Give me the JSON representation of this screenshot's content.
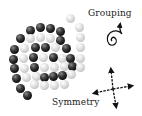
{
  "diagram": {
    "labels": {
      "grouping": "Grouping",
      "symmetry": "Symmetry"
    },
    "icons": {
      "grouping": "spiral-arrow-icon",
      "symmetry": "four-way-arrows-icon"
    },
    "colors": {
      "dark_ball": "#111111",
      "light_ball": "#d0d0d0",
      "ink": "#111111",
      "background": "#ffffff"
    },
    "balls": [
      {
        "x": 30,
        "y": 30,
        "c": "dark"
      },
      {
        "x": 40,
        "y": 27,
        "c": "dark"
      },
      {
        "x": 50,
        "y": 28,
        "c": "dark"
      },
      {
        "x": 60,
        "y": 31,
        "c": "dark"
      },
      {
        "x": 70,
        "y": 18,
        "c": "light"
      },
      {
        "x": 79,
        "y": 27,
        "c": "light"
      },
      {
        "x": 20,
        "y": 38,
        "c": "dark"
      },
      {
        "x": 30,
        "y": 38,
        "c": "light"
      },
      {
        "x": 40,
        "y": 37,
        "c": "light"
      },
      {
        "x": 50,
        "y": 38,
        "c": "light"
      },
      {
        "x": 60,
        "y": 40,
        "c": "dark"
      },
      {
        "x": 80,
        "y": 37,
        "c": "light"
      },
      {
        "x": 14,
        "y": 49,
        "c": "dark"
      },
      {
        "x": 24,
        "y": 48,
        "c": "light"
      },
      {
        "x": 35,
        "y": 47,
        "c": "dark"
      },
      {
        "x": 45,
        "y": 47,
        "c": "dark"
      },
      {
        "x": 55,
        "y": 47,
        "c": "light"
      },
      {
        "x": 66,
        "y": 48,
        "c": "dark"
      },
      {
        "x": 80,
        "y": 47,
        "c": "light"
      },
      {
        "x": 13,
        "y": 59,
        "c": "dark"
      },
      {
        "x": 23,
        "y": 58,
        "c": "light"
      },
      {
        "x": 33,
        "y": 57,
        "c": "dark"
      },
      {
        "x": 43,
        "y": 57,
        "c": "light"
      },
      {
        "x": 53,
        "y": 57,
        "c": "dark"
      },
      {
        "x": 62,
        "y": 58,
        "c": "light"
      },
      {
        "x": 70,
        "y": 58,
        "c": "dark"
      },
      {
        "x": 80,
        "y": 58,
        "c": "light"
      },
      {
        "x": 14,
        "y": 68,
        "c": "dark"
      },
      {
        "x": 24,
        "y": 68,
        "c": "light"
      },
      {
        "x": 34,
        "y": 67,
        "c": "dark"
      },
      {
        "x": 44,
        "y": 67,
        "c": "light"
      },
      {
        "x": 54,
        "y": 67,
        "c": "light"
      },
      {
        "x": 64,
        "y": 66,
        "c": "light"
      },
      {
        "x": 72,
        "y": 66,
        "c": "dark"
      },
      {
        "x": 80,
        "y": 67,
        "c": "light"
      },
      {
        "x": 16,
        "y": 78,
        "c": "dark"
      },
      {
        "x": 26,
        "y": 77,
        "c": "light"
      },
      {
        "x": 36,
        "y": 76,
        "c": "light"
      },
      {
        "x": 44,
        "y": 77,
        "c": "dark"
      },
      {
        "x": 53,
        "y": 76,
        "c": "dark"
      },
      {
        "x": 62,
        "y": 75,
        "c": "dark"
      },
      {
        "x": 71,
        "y": 74,
        "c": "light"
      },
      {
        "x": 20,
        "y": 88,
        "c": "dark"
      },
      {
        "x": 34,
        "y": 84,
        "c": "light"
      },
      {
        "x": 44,
        "y": 85,
        "c": "light"
      },
      {
        "x": 54,
        "y": 85,
        "c": "light"
      },
      {
        "x": 64,
        "y": 84,
        "c": "light"
      },
      {
        "x": 27,
        "y": 95,
        "c": "dark"
      }
    ]
  }
}
